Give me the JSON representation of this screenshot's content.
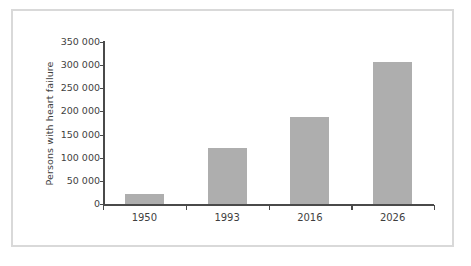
{
  "chart_data": {
    "type": "bar",
    "title": "",
    "subtitle": "",
    "xlabel": "",
    "ylabel": "Persons with heart failure",
    "categories": [
      "1950",
      "1993",
      "2016",
      "2026"
    ],
    "values": [
      22000,
      120000,
      187000,
      307000
    ],
    "series": [
      {
        "name": "Persons with heart failure",
        "values": [
          22000,
          120000,
          187000,
          307000
        ]
      }
    ],
    "ylim": [
      0,
      350000
    ],
    "yticks": [
      0,
      50000,
      100000,
      150000,
      200000,
      250000,
      300000,
      350000
    ],
    "ytick_labels": [
      "0",
      "50 000",
      "100 000",
      "150 000",
      "200 000",
      "250 000",
      "300 000",
      "350 000"
    ],
    "grid": false,
    "legend": false,
    "legend_position": "none",
    "bar_color": "#aeaeae",
    "axis_color": "#4a4a4a",
    "text_color": "#3f3f3f",
    "frame_color": "#d9d9d9",
    "background_color": "#ffffff"
  }
}
